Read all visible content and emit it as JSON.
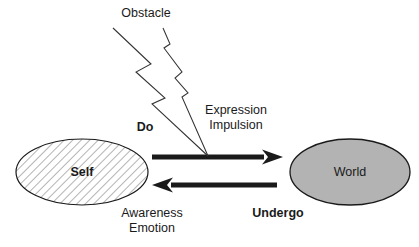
{
  "diagram": {
    "canvas": {
      "width": 419,
      "height": 247,
      "background": "#ffffff"
    },
    "labels": {
      "obstacle": "Obstacle",
      "do": "Do",
      "expression": "Expression",
      "impulsion": "Impulsion",
      "self": "Self",
      "world": "World",
      "awareness": "Awareness",
      "emotion": "Emotion",
      "undergo": "Undergo"
    },
    "nodes": [
      {
        "id": "self",
        "label": "Self",
        "shape": "ellipse",
        "fill": "hatched-diagonal",
        "fill_color": "#ffffff",
        "stroke": "#1a1a1a",
        "cx": 82,
        "cy": 172,
        "rx": 66,
        "ry": 33
      },
      {
        "id": "world",
        "label": "World",
        "shape": "ellipse",
        "fill": "solid",
        "fill_color": "#b3b3b3",
        "stroke": "#1a1a1a",
        "cx": 350,
        "cy": 172,
        "rx": 60,
        "ry": 33
      }
    ],
    "edges": [
      {
        "id": "do-arrow",
        "from": "self",
        "to": "world",
        "direction": "right",
        "label": "Do",
        "secondary_labels": [
          "Expression",
          "Impulsion"
        ],
        "color": "#1a1a1a",
        "thickness": 5
      },
      {
        "id": "undergo-arrow",
        "from": "world",
        "to": "self",
        "direction": "left",
        "label": "Undergo",
        "secondary_labels": [
          "Awareness",
          "Emotion"
        ],
        "color": "#1a1a1a",
        "thickness": 5
      }
    ],
    "annotations": [
      {
        "id": "obstacle-bolt",
        "label": "Obstacle",
        "shape": "lightning-bolt",
        "stroke": "#333333",
        "stroke_width": 1,
        "points_to": "do-arrow"
      }
    ],
    "colors": {
      "ink": "#1a1a1a",
      "bolt_stroke": "#333333",
      "world_fill": "#b3b3b3",
      "self_fill": "#ffffff",
      "hatch": "#555555",
      "background": "#ffffff"
    }
  }
}
